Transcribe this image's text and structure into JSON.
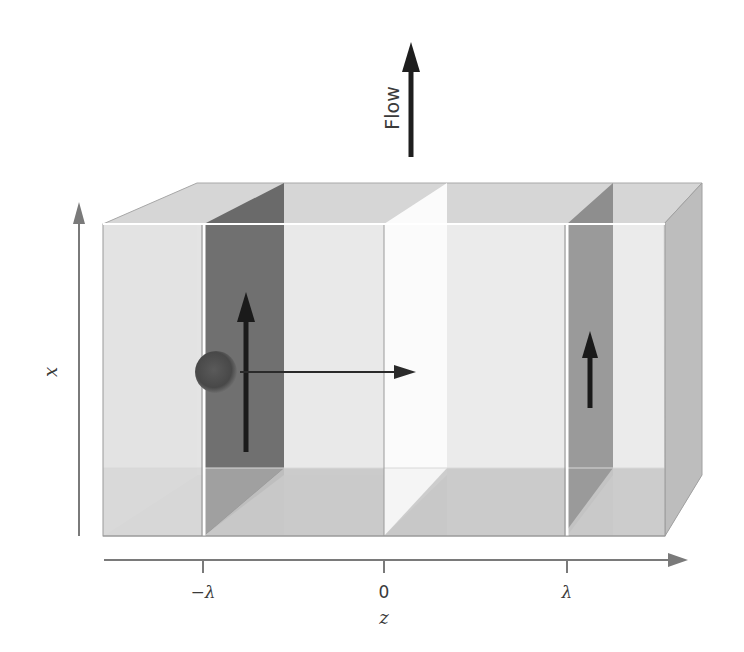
{
  "figure": {
    "flow_label": "Flow",
    "x_axis_label": "x",
    "z_axis_label": "z",
    "z_ticks": [
      {
        "label": "−λ",
        "value": "-lambda"
      },
      {
        "label": "0",
        "value": "0"
      },
      {
        "label": "λ",
        "value": "lambda"
      }
    ],
    "elements": {
      "box": "transparent rectangular prism (channel)",
      "planes": [
        {
          "position": "-lambda",
          "shade": "dark"
        },
        {
          "position": "0",
          "shade": "white"
        },
        {
          "position": "lambda",
          "shade": "medium"
        }
      ],
      "particle": "sphere near plane at -lambda",
      "arrows": [
        {
          "name": "large upward arrow at -lambda plane"
        },
        {
          "name": "horizontal arrow toward +z"
        },
        {
          "name": "small upward arrow at lambda plane"
        },
        {
          "name": "flow arrow (upward)"
        }
      ]
    },
    "colors": {
      "box_front": "#e2e2e2",
      "box_top": "#d4d4d4",
      "box_side": "#bdbdbd",
      "box_bottom": "#c6c6c6",
      "plane_dark": "#6e6e6e",
      "plane_medium": "#9a9a9a",
      "plane_white": "#fafafa",
      "arrow": "#1e1e1e",
      "axis": "#7a7a7a"
    }
  }
}
